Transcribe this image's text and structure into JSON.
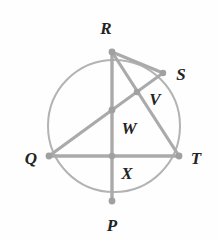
{
  "figure": {
    "background_color": "#fefefe",
    "stroke_color": "#b3b3b3",
    "chord_color": "#aaaaaa",
    "vertex_color": "#a0a0a0",
    "label_color": "#232323",
    "width": 217,
    "height": 241
  },
  "circle": {
    "center_x": 114,
    "center_y": 126,
    "radius": 66,
    "stroke_width": 2
  },
  "points": [
    {
      "id": "R",
      "label": "R",
      "x": 112,
      "y": 52,
      "label_x": 106,
      "label_y": 28,
      "on_circle": true,
      "dot_r": 3.4
    },
    {
      "id": "S",
      "label": "S",
      "x": 163,
      "y": 73,
      "label_x": 181,
      "label_y": 74,
      "on_circle": true,
      "dot_r": 3.2
    },
    {
      "id": "T",
      "label": "T",
      "x": 179,
      "y": 156,
      "label_x": 196,
      "label_y": 158,
      "on_circle": true,
      "dot_r": 3.4
    },
    {
      "id": "P",
      "label": "P",
      "x": 112,
      "y": 201,
      "label_x": 112,
      "label_y": 225,
      "on_circle": true,
      "dot_r": 3.4
    },
    {
      "id": "Q",
      "label": "Q",
      "x": 49,
      "y": 156,
      "label_x": 31,
      "label_y": 158,
      "on_circle": true,
      "dot_r": 3.4
    },
    {
      "id": "V",
      "label": "V",
      "x": 137,
      "y": 92,
      "label_x": 155,
      "label_y": 99,
      "on_circle": false,
      "dot_r": 3.2
    },
    {
      "id": "W",
      "label": "W",
      "x": 112,
      "y": 110,
      "label_x": 129,
      "label_y": 128,
      "on_circle": false,
      "dot_r": 3.4
    },
    {
      "id": "X",
      "label": "X",
      "x": 112,
      "y": 156,
      "label_x": 127,
      "label_y": 173,
      "on_circle": false,
      "dot_r": 3.2
    }
  ],
  "segments": [
    {
      "id": "R-S",
      "from": "R",
      "to": "S",
      "x1": 112,
      "y1": 52,
      "x2": 163,
      "y2": 73,
      "width": 3.0
    },
    {
      "id": "R-T",
      "from": "R",
      "to": "T",
      "x1": 112,
      "y1": 52,
      "x2": 179,
      "y2": 156,
      "width": 3.2
    },
    {
      "id": "S-W",
      "from": "S",
      "to": "W",
      "x1": 163,
      "y1": 73,
      "x2": 112,
      "y2": 110,
      "width": 3.0
    },
    {
      "id": "R-P",
      "from": "R",
      "to": "P",
      "x1": 112,
      "y1": 52,
      "x2": 112,
      "y2": 201,
      "width": 3.4
    },
    {
      "id": "Q-T",
      "from": "Q",
      "to": "T",
      "x1": 49,
      "y1": 156,
      "x2": 179,
      "y2": 156,
      "width": 3.4
    },
    {
      "id": "Q-W",
      "from": "Q",
      "to": "W",
      "x1": 49,
      "y1": 156,
      "x2": 112,
      "y2": 110,
      "width": 3.2
    }
  ]
}
